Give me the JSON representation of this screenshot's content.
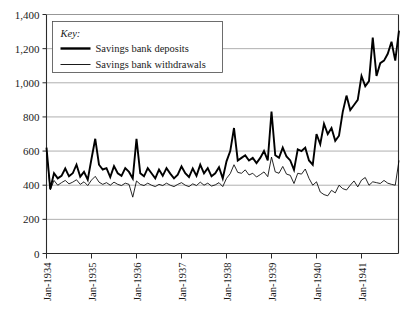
{
  "legend": {
    "key_label": "Key:",
    "entries": [
      {
        "label": "Savings bank deposits",
        "style": "thick"
      },
      {
        "label": "Savings bank withdrawals",
        "style": "thin"
      }
    ]
  },
  "axis": {
    "y_ticks": [
      "0",
      "200",
      "400",
      "600",
      "800",
      "1,000",
      "1,200",
      "1,400"
    ],
    "x_ticks": [
      "Jan-1934",
      "Jan-1935",
      "Jan-1936",
      "Jan-1937",
      "Jan-1938",
      "Jan-1939",
      "Jan-1940",
      "Jan-1941"
    ]
  },
  "colors": {
    "line": "#000000",
    "grid": "#8c8c8c",
    "axis": "#2b2b2b",
    "background": "#ffffff"
  },
  "chart_data": {
    "type": "line",
    "title": "",
    "xlabel": "",
    "ylabel": "",
    "ylim": [
      0,
      1400
    ],
    "ytick_values": [
      0,
      200,
      400,
      600,
      800,
      1000,
      1200,
      1400
    ],
    "grid": true,
    "legend_position": "top-left-inside",
    "x_tick_labels": [
      "Jan-1934",
      "Jan-1935",
      "Jan-1936",
      "Jan-1937",
      "Jan-1938",
      "Jan-1939",
      "Jan-1940",
      "Jan-1941"
    ],
    "x_tick_indices": [
      0,
      12,
      24,
      36,
      48,
      60,
      72,
      84
    ],
    "x_start": "Jan-1934",
    "x_end": "Nov-1941",
    "n_points": 95,
    "series": [
      {
        "name": "Savings bank deposits",
        "style": "thick",
        "values": [
          620,
          378,
          470,
          440,
          455,
          498,
          452,
          470,
          520,
          450,
          478,
          432,
          555,
          672,
          520,
          492,
          500,
          448,
          512,
          470,
          455,
          500,
          478,
          440,
          672,
          470,
          452,
          500,
          470,
          440,
          492,
          455,
          500,
          468,
          440,
          462,
          510,
          470,
          448,
          498,
          455,
          520,
          470,
          500,
          452,
          470,
          505,
          440,
          540,
          600,
          735,
          545,
          560,
          575,
          545,
          560,
          530,
          560,
          600,
          545,
          832,
          575,
          560,
          620,
          568,
          545,
          490,
          610,
          600,
          620,
          545,
          520,
          700,
          640,
          760,
          700,
          735,
          660,
          690,
          830,
          925,
          840,
          870,
          900,
          1040,
          980,
          1010,
          1265,
          1040,
          1115,
          1130,
          1170,
          1240,
          1130,
          1305
        ]
      },
      {
        "name": "Savings bank withdrawals",
        "style": "thin",
        "values": [
          600,
          372,
          428,
          400,
          415,
          428,
          408,
          418,
          432,
          405,
          420,
          398,
          430,
          452,
          418,
          405,
          415,
          400,
          418,
          405,
          398,
          412,
          405,
          330,
          425,
          405,
          398,
          412,
          400,
          392,
          405,
          398,
          412,
          400,
          392,
          405,
          415,
          400,
          392,
          408,
          398,
          418,
          400,
          412,
          395,
          402,
          415,
          392,
          440,
          468,
          520,
          475,
          470,
          490,
          460,
          470,
          448,
          462,
          478,
          450,
          565,
          478,
          470,
          510,
          465,
          458,
          410,
          470,
          465,
          495,
          440,
          400,
          420,
          360,
          345,
          338,
          370,
          355,
          400,
          380,
          372,
          400,
          425,
          390,
          430,
          445,
          400,
          420,
          415,
          410,
          428,
          412,
          405,
          400,
          545
        ]
      }
    ]
  }
}
